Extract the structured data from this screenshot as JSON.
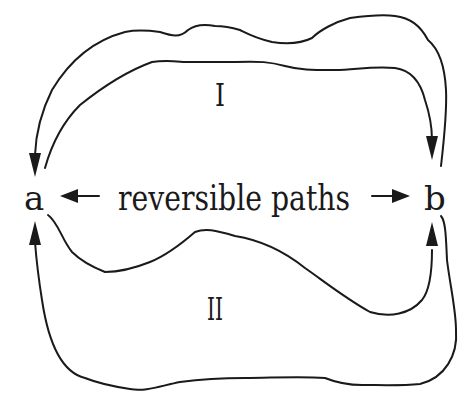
{
  "diagram": {
    "nodes": {
      "a": {
        "label": "a"
      },
      "b": {
        "label": "b"
      }
    },
    "center_label": "reversible paths",
    "paths": [
      {
        "id": "I",
        "label": "I",
        "from": "a",
        "to": "b",
        "position": "upper"
      },
      {
        "id": "II",
        "label": "II",
        "from": "a",
        "to": "b",
        "position": "lower"
      }
    ],
    "arrow_descriptions": {
      "center_left": "arrow pointing to a",
      "center_right": "arrow pointing to b",
      "upper_outer": "returns from b to a (arrow into a from above)",
      "upper_inner": "goes from a to b (arrow into b from above)",
      "lower_inner": "goes from a to b (arrow into b from below)",
      "lower_outer": "returns from b to a (arrow into a from below)"
    },
    "colors": {
      "line": "#1a1a1a",
      "background": "#ffffff"
    }
  }
}
